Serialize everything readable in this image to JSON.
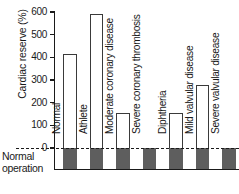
{
  "chart_data": {
    "type": "bar",
    "title": "",
    "xlabel": "",
    "ylabel": "Cardiac reserve (%)",
    "ylim": [
      0,
      600
    ],
    "yticks": [
      0,
      100,
      200,
      300,
      400,
      500,
      600
    ],
    "ytick_labels": [
      "0",
      "100",
      "200",
      "300",
      "400",
      "500",
      "600"
    ],
    "grid": false,
    "legend": "none",
    "categories": [
      "Normal",
      "Athlete",
      "Moderate coronary disease",
      "Severe coronary thrombosis",
      "Diphtheria",
      "Mild valvular disease",
      "Severe valvular disease"
    ],
    "values": [
      415,
      590,
      155,
      0,
      155,
      280,
      0
    ],
    "baseline_value": 0,
    "baseline_label": "Normal operation",
    "series": [
      {
        "name": "Cardiac reserve",
        "values": [
          415,
          590,
          155,
          0,
          155,
          280,
          0
        ]
      }
    ]
  },
  "axis": {
    "ylabel": "Cardiac reserve (%)",
    "ticks": [
      "600",
      "500",
      "400",
      "300",
      "200",
      "100",
      "0"
    ]
  },
  "annotations": {
    "normal_operation_line1": "Normal",
    "normal_operation_line2": "operation"
  },
  "colors": {
    "bar_outline": "#3a3a3a",
    "bar_fill": "#ffffff",
    "normal_block": "#5e5e5e",
    "axis": "#1a1a1a",
    "background": "#ffffff"
  }
}
